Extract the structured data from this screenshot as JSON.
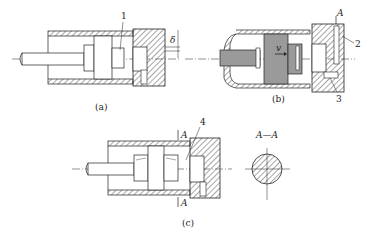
{
  "figure": {
    "panels": [
      {
        "id": "a",
        "caption": "(a)",
        "callouts": [
          "1"
        ],
        "dimension_symbol": "δ"
      },
      {
        "id": "b",
        "caption": "(b)",
        "callouts": [
          "2",
          "3"
        ],
        "section_marker": "A",
        "velocity_symbol": "v"
      },
      {
        "id": "c",
        "caption": "(c)",
        "callouts": [
          "4"
        ],
        "section_markers": [
          "A",
          "A"
        ],
        "section_view_title": "A—A"
      }
    ]
  },
  "colors": {
    "line": "#222222",
    "fill_gray": "#9a9a9a",
    "background": "#ffffff"
  }
}
